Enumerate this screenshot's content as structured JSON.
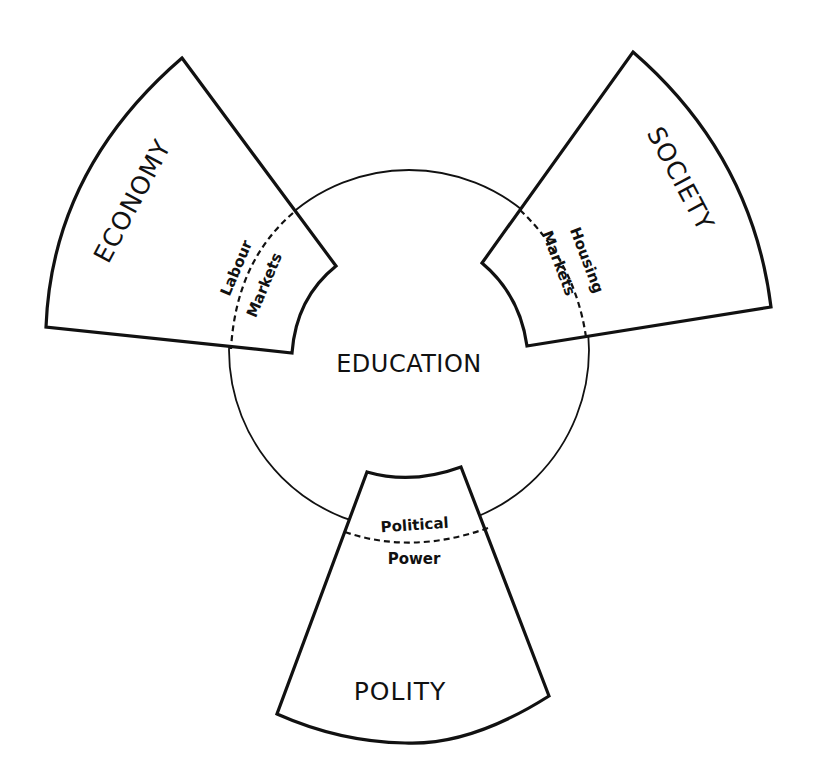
{
  "diagram": {
    "center": {
      "label": "EDUCATION"
    },
    "sectors": [
      {
        "id": "economy",
        "label": "ECONOMY",
        "interface_lines": [
          "Labour",
          "Markets"
        ]
      },
      {
        "id": "society",
        "label": "SOCIETY",
        "interface_lines": [
          "Housing",
          "Markets"
        ]
      },
      {
        "id": "polity",
        "label": "POLITY",
        "interface_lines": [
          "Political",
          "Power"
        ]
      }
    ],
    "colors": {
      "line": "#111111",
      "background": "#ffffff"
    }
  }
}
